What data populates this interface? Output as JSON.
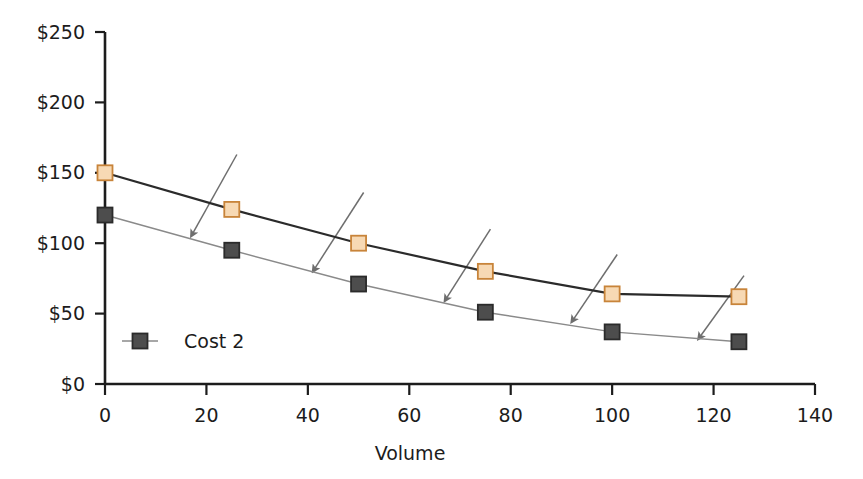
{
  "chart_data": {
    "type": "line",
    "title": "",
    "xlabel": "Volume",
    "ylabel": "",
    "xlim": [
      0,
      140
    ],
    "ylim": [
      0,
      250
    ],
    "grid": false,
    "x": [
      0,
      25,
      50,
      75,
      100,
      125
    ],
    "series": [
      {
        "name": "Cost 1",
        "values": [
          150,
          124,
          100,
          80,
          64,
          62
        ],
        "marker": "square",
        "marker_fill": "#F7D9B4",
        "marker_edge": "#C8843A",
        "line_color": "#2B2B2B",
        "in_legend": false
      },
      {
        "name": "Cost 2",
        "values": [
          120,
          95,
          71,
          51,
          37,
          30
        ],
        "marker": "square",
        "marker_fill": "#4D4D4D",
        "marker_edge": "#2B2B2B",
        "line_color": "#8A8A8A",
        "in_legend": true
      }
    ],
    "xticks": [
      0,
      20,
      40,
      60,
      80,
      100,
      120,
      140
    ],
    "xtick_labels": [
      "0",
      "20",
      "40",
      "60",
      "80",
      "100",
      "120",
      "140"
    ],
    "yticks": [
      0,
      50,
      100,
      150,
      200,
      250
    ],
    "ytick_labels": [
      "$0",
      "$50",
      "$100",
      "$150",
      "$200",
      "$250"
    ],
    "annotations": {
      "type": "arrows",
      "description": "Five diagonal arrows pointing down-left from the upper cost curve toward the lower cost curve",
      "count": 5,
      "color": "#6E6E6E",
      "arrows": [
        {
          "x1": 26,
          "y1": 163,
          "x2": 17,
          "y2": 105
        },
        {
          "x1": 51,
          "y1": 136,
          "x2": 41,
          "y2": 80
        },
        {
          "x1": 76,
          "y1": 110,
          "x2": 67,
          "y2": 59
        },
        {
          "x1": 101,
          "y1": 92,
          "x2": 92,
          "y2": 44
        },
        {
          "x1": 126,
          "y1": 77,
          "x2": 117,
          "y2": 32
        }
      ]
    },
    "legend": {
      "position": "inside-lower-left",
      "entries": [
        {
          "label": "Cost 2",
          "marker_fill": "#4D4D4D",
          "line_color": "#8A8A8A"
        }
      ]
    },
    "axis_color": "#1c1c1c",
    "background": "#FFFFFF"
  }
}
